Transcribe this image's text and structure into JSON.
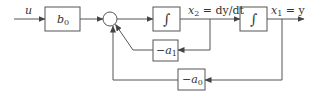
{
  "diagram": {
    "type": "control-block-diagram",
    "colors": {
      "stroke": "#555555",
      "text": "#333333",
      "background": "#ffffff"
    },
    "input_label": "u",
    "blocks": {
      "gain_b0": {
        "main": "b",
        "sub": "0"
      },
      "integrator_1": {
        "symbol": "∫"
      },
      "integrator_2": {
        "symbol": "∫"
      },
      "gain_a1": {
        "main": "−a",
        "sub": "1"
      },
      "gain_a0": {
        "main": "−a",
        "sub": "0"
      }
    },
    "signals": {
      "x2": {
        "main": "x",
        "sub": "2",
        "rest": " = dy/dt"
      },
      "x1": {
        "main": "x",
        "sub": "1",
        "rest": " = y"
      }
    },
    "summing_junction": {
      "count": 1
    }
  }
}
